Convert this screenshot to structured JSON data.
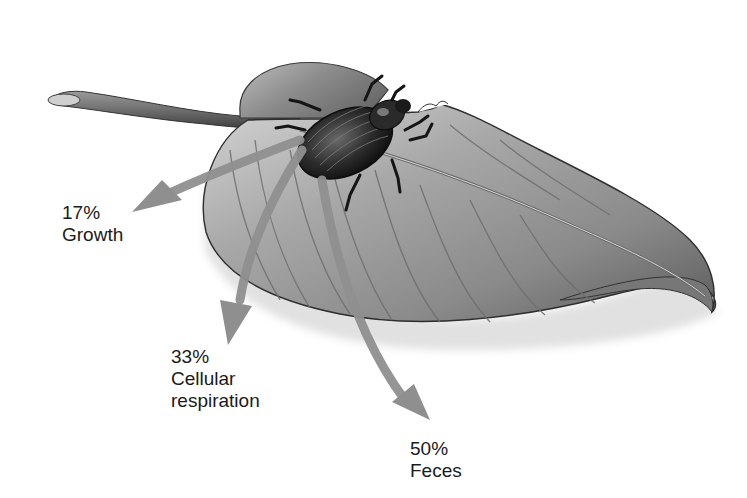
{
  "diagram": {
    "elements": {
      "leaf": "leaf",
      "consumer": "beetle"
    },
    "colors": {
      "background": "#ffffff",
      "arrow": "#8f8f8f",
      "leaf_light": "#c9c9c9",
      "leaf_mid": "#9a9a9a",
      "leaf_dark": "#555555",
      "beetle": "#2a2a2a",
      "text": "#1a1a1a"
    },
    "flows": [
      {
        "id": "growth",
        "percent": "17%",
        "label": "Growth",
        "value": 17
      },
      {
        "id": "respiration",
        "percent": "33%",
        "label_line1": "Cellular",
        "label_line2": "respiration",
        "value": 33
      },
      {
        "id": "feces",
        "percent": "50%",
        "label": "Feces",
        "value": 50
      }
    ]
  }
}
